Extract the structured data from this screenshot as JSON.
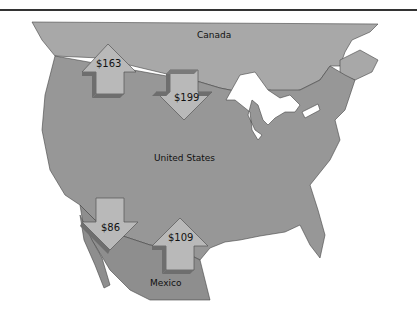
{
  "map": {
    "regions": [
      {
        "name": "Canada",
        "label": "Canada"
      },
      {
        "name": "United States",
        "label": "United States"
      },
      {
        "name": "Mexico",
        "label": "Mexico"
      }
    ],
    "arrows": [
      {
        "id": "arrow-163",
        "value": "$163",
        "direction": "up"
      },
      {
        "id": "arrow-199",
        "value": "$199",
        "direction": "down"
      },
      {
        "id": "arrow-86",
        "value": "$86",
        "direction": "down"
      },
      {
        "id": "arrow-109",
        "value": "$109",
        "direction": "up"
      }
    ],
    "colors": {
      "canada": "#a8a8a8",
      "us": "#979797",
      "mexico": "#8e8e8e",
      "arrow_face": "#b9b9b9",
      "arrow_side": "#6e6e6e",
      "water": "#ffffff",
      "border": "#333333"
    }
  }
}
